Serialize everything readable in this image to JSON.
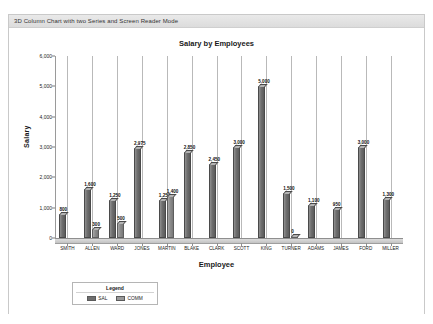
{
  "window": {
    "title": "3D Column Chart with two Series and Screen Reader Mode"
  },
  "colors": {
    "sal_series": "#6f6f6f",
    "comm_series": "#9a9a9a",
    "plot_background": "#ffffff",
    "gridline": "#b9b9b9",
    "axis": "#8f8f8f",
    "title_bar": "#e4e4e4"
  },
  "legend": {
    "title": "Legend",
    "items": [
      {
        "label": "SAL",
        "color": "#6f6f6f"
      },
      {
        "label": "COMM",
        "color": "#9a9a9a"
      }
    ]
  },
  "chart_data": {
    "type": "bar",
    "title": "Salary by Employees",
    "xlabel": "Employee",
    "ylabel": "Salary",
    "ylim": [
      0,
      6000
    ],
    "yticks": [
      "0",
      "1,000",
      "2,000",
      "3,000",
      "4,000",
      "5,000",
      "6,000"
    ],
    "ytick_values": [
      0,
      1000,
      2000,
      3000,
      4000,
      5000,
      6000
    ],
    "grid": true,
    "legend_position": "bottom-left",
    "categories": [
      "SMITH",
      "ALLEN",
      "WARD",
      "JONES",
      "MARTIN",
      "BLAKE",
      "CLARK",
      "SCOTT",
      "KING",
      "TURNER",
      "ADAMS",
      "JAMES",
      "FORD",
      "MILLER"
    ],
    "series": [
      {
        "name": "SAL",
        "values": [
          800,
          1600,
          1250,
          2975,
          1250,
          2850,
          2450,
          3000,
          5000,
          1500,
          1100,
          950,
          3000,
          1300
        ],
        "labels": [
          "800",
          "1,600",
          "1,250",
          "2,975",
          "1,250",
          "2,850",
          "2,450",
          "3,000",
          "5,000",
          "1,500",
          "1,100",
          "950",
          "3,000",
          "1,300"
        ]
      },
      {
        "name": "COMM",
        "values": [
          null,
          300,
          500,
          null,
          1400,
          null,
          null,
          null,
          null,
          0,
          null,
          null,
          null,
          null
        ],
        "labels": [
          "",
          "300",
          "500",
          "",
          "1,400",
          "",
          "",
          "",
          "",
          "0",
          "",
          "",
          "",
          ""
        ]
      }
    ]
  }
}
